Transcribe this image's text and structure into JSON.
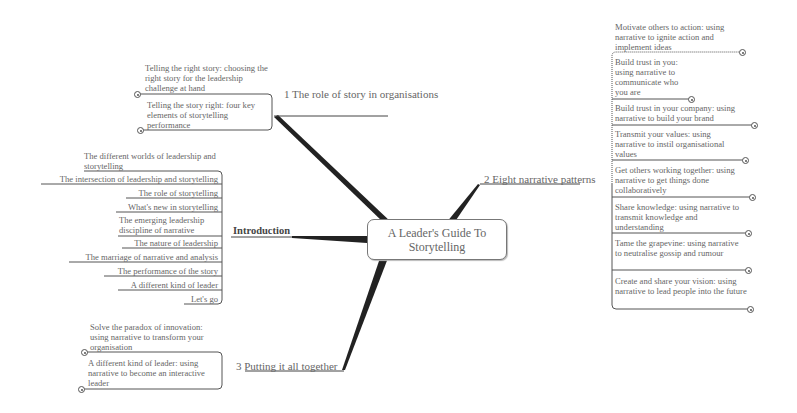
{
  "center": {
    "title": "A Leader's Guide To Storytelling"
  },
  "branches": {
    "role_of_story": {
      "label": "1 The role of story in organisations",
      "children": [
        "Telling the right story: choosing the right story for the leadership challenge at hand",
        "Telling the story right: four key elements of storytelling performance"
      ]
    },
    "introduction": {
      "label": "Introduction",
      "children": [
        "The different worlds of leadership and storytelling",
        "The intersection of leadership and storytelling",
        "The role of storytelling",
        "What's new in storytelling",
        "The emerging leadership discipline of narrative",
        "The nature of leadership",
        "The marriage of narrative and analysis",
        "The performance of the story",
        "A different kind of leader",
        "Let's go"
      ]
    },
    "putting_together": {
      "label": "3 Putting it all together",
      "children": [
        "Solve the paradox of innovation: using narrative to transform your organisation",
        "A different kind of leader: using narrative to become an interactive leader"
      ]
    },
    "eight_patterns": {
      "label": "2 Eight narrative patterns",
      "children": [
        "Motivate others to action: using narrative to ignite action and implement ideas",
        "Build trust in you: using narrative to communicate who you are",
        "Build trust in your company: using narrative to build your brand",
        "Transmit your values: using narrative to instil organisational values",
        "Get others working together: using narrative to get things done collaboratively",
        "Share knowledge: using narrative to transmit knowledge and understanding",
        "Tame the grapevine: using narrative to neutralise gossip and rumour",
        "Create and share your vision: using narrative to lead people into the future"
      ]
    }
  },
  "colors": {
    "text": "#666666",
    "line": "#333333",
    "background": "#ffffff"
  }
}
